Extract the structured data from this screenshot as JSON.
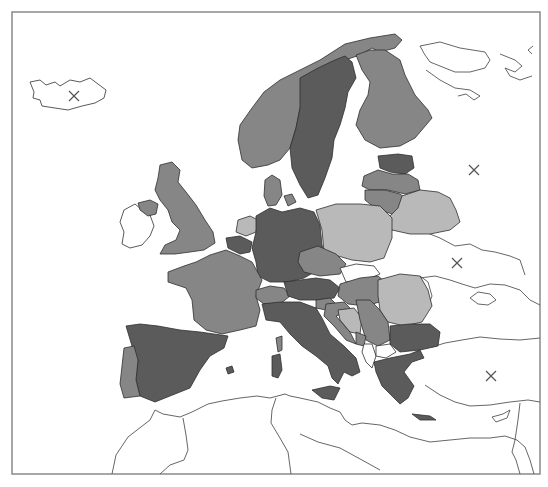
{
  "map": {
    "title": "",
    "type": "choropleth",
    "region": "Europe",
    "frame": {
      "x": 12,
      "y": 12,
      "width": 528,
      "height": 462
    },
    "shade_colors": {
      "dark": "#5b5b5b",
      "mid": "#868686",
      "light": "#b9b9b9",
      "none": "#ffffff",
      "border": "#2e2e2e",
      "frame": "#8a8a8a"
    },
    "countries": [
      {
        "name": "Iceland",
        "shade": "none"
      },
      {
        "name": "Ireland",
        "shade": "none"
      },
      {
        "name": "Northern Ireland / UK",
        "shade": "mid"
      },
      {
        "name": "United Kingdom",
        "shade": "mid"
      },
      {
        "name": "Norway",
        "shade": "mid"
      },
      {
        "name": "Sweden",
        "shade": "dark"
      },
      {
        "name": "Finland",
        "shade": "mid"
      },
      {
        "name": "Russia",
        "shade": "none"
      },
      {
        "name": "Estonia",
        "shade": "dark"
      },
      {
        "name": "Latvia",
        "shade": "mid"
      },
      {
        "name": "Lithuania",
        "shade": "mid"
      },
      {
        "name": "Belarus",
        "shade": "light"
      },
      {
        "name": "Poland",
        "shade": "light"
      },
      {
        "name": "Denmark",
        "shade": "mid"
      },
      {
        "name": "Netherlands",
        "shade": "light"
      },
      {
        "name": "Belgium",
        "shade": "dark"
      },
      {
        "name": "Germany",
        "shade": "dark"
      },
      {
        "name": "France",
        "shade": "mid"
      },
      {
        "name": "Spain",
        "shade": "dark"
      },
      {
        "name": "Portugal",
        "shade": "mid"
      },
      {
        "name": "Switzerland",
        "shade": "mid"
      },
      {
        "name": "Italy",
        "shade": "dark"
      },
      {
        "name": "Austria",
        "shade": "dark"
      },
      {
        "name": "Czech Republic",
        "shade": "mid"
      },
      {
        "name": "Slovakia",
        "shade": "none"
      },
      {
        "name": "Hungary",
        "shade": "mid"
      },
      {
        "name": "Slovenia",
        "shade": "mid"
      },
      {
        "name": "Croatia",
        "shade": "mid"
      },
      {
        "name": "Bosnia and Herzegovina",
        "shade": "light"
      },
      {
        "name": "Serbia",
        "shade": "mid"
      },
      {
        "name": "Montenegro",
        "shade": "mid"
      },
      {
        "name": "Albania",
        "shade": "none"
      },
      {
        "name": "North Macedonia",
        "shade": "none"
      },
      {
        "name": "Romania",
        "shade": "light"
      },
      {
        "name": "Moldova",
        "shade": "none"
      },
      {
        "name": "Ukraine",
        "shade": "none"
      },
      {
        "name": "Bulgaria",
        "shade": "dark"
      },
      {
        "name": "Greece",
        "shade": "dark"
      },
      {
        "name": "Turkey",
        "shade": "none"
      },
      {
        "name": "Corsica",
        "shade": "mid"
      },
      {
        "name": "Sardinia",
        "shade": "dark"
      },
      {
        "name": "Sicily",
        "shade": "dark"
      },
      {
        "name": "Crete",
        "shade": "dark"
      },
      {
        "name": "Mallorca",
        "shade": "dark"
      },
      {
        "name": "Cyprus",
        "shade": "none"
      },
      {
        "name": "Morocco",
        "shade": "none"
      },
      {
        "name": "Algeria",
        "shade": "none"
      },
      {
        "name": "Tunisia",
        "shade": "none"
      },
      {
        "name": "Libya",
        "shade": "none"
      }
    ],
    "markers": [
      {
        "symbol": "×",
        "label": "Iceland",
        "x": 74,
        "y": 96
      },
      {
        "symbol": "×",
        "label": "Russia",
        "x": 474,
        "y": 170
      },
      {
        "symbol": "×",
        "label": "Ukraine",
        "x": 457,
        "y": 263
      },
      {
        "symbol": "×",
        "label": "Turkey",
        "x": 491,
        "y": 376
      }
    ]
  }
}
